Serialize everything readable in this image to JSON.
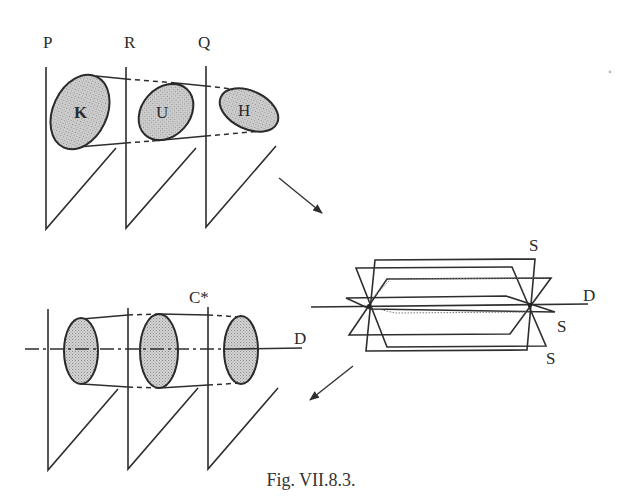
{
  "figure": {
    "caption": "Fig. VII.8.3.",
    "top_panel": {
      "plane_labels": [
        "P",
        "R",
        "Q"
      ],
      "region_labels": [
        "K",
        "U",
        "H"
      ]
    },
    "right_panel": {
      "axis_label": "D",
      "plane_labels": [
        "S",
        "S",
        "S"
      ]
    },
    "bottom_panel": {
      "cylinder_label": "C*",
      "axis_label": "D"
    },
    "arrows": [
      {
        "name": "top-to-right",
        "direction": "down-right"
      },
      {
        "name": "right-to-bottom",
        "direction": "down-left"
      }
    ],
    "colors": {
      "line": "#2e2e2e",
      "fill": "#c8c8c8",
      "background": "#ffffff"
    }
  }
}
